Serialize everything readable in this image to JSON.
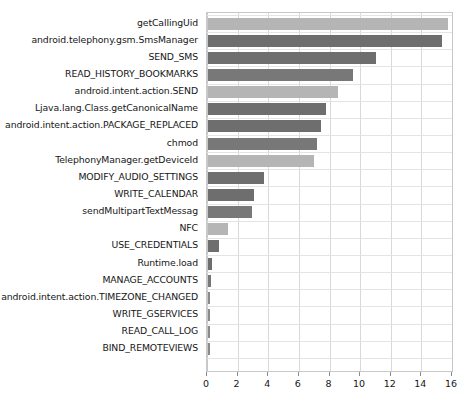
{
  "chart_data": {
    "type": "bar",
    "orientation": "horizontal",
    "title": "",
    "subtitle": "",
    "xlabel": "",
    "ylabel": "",
    "xlim": [
      0,
      16
    ],
    "xticks": [
      0,
      2,
      4,
      6,
      8,
      10,
      12,
      14,
      16
    ],
    "xtick_labels": [
      "0",
      "2",
      "4",
      "6",
      "8",
      "10",
      "12",
      "14",
      "16"
    ],
    "grid": true,
    "legend": null,
    "legend_position": "none",
    "categories": [
      "getCallingUid",
      "android.telephony.gsm.SmsManager",
      "SEND_SMS",
      "READ_HISTORY_BOOKMARKS",
      "android.intent.action.SEND",
      "Ljava.lang.Class.getCanonicalName",
      "android.intent.action.PACKAGE_REPLACED",
      "chmod",
      "TelephonyManager.getDeviceId",
      "MODIFY_AUDIO_SETTINGS",
      "WRITE_CALENDAR",
      "sendMultipartTextMessag",
      "NFC",
      "USE_CREDENTIALS",
      "Runtime.load",
      "MANAGE_ACCOUNTS",
      "android.intent.action.TIMEZONE_CHANGED",
      "WRITE_GSERVICES",
      "READ_CALL_LOG",
      "BIND_REMOTEVIEWS"
    ],
    "values": [
      15.7,
      15.3,
      11.0,
      9.5,
      8.5,
      7.7,
      7.4,
      7.1,
      6.9,
      3.65,
      3.0,
      2.85,
      1.3,
      0.7,
      0.27,
      0.22,
      0.1,
      0.1,
      0.1,
      0.1
    ],
    "bar_colors": [
      "#b5b5b5",
      "#6e6e6e",
      "#6e6e6e",
      "#787878",
      "#b5b5b5",
      "#6e6e6e",
      "#6e6e6e",
      "#787878",
      "#b5b5b5",
      "#6e6e6e",
      "#6e6e6e",
      "#787878",
      "#b5b5b5",
      "#6e6e6e",
      "#6e6e6e",
      "#787878",
      "#8a8a8a",
      "#8a8a8a",
      "#8a8a8a",
      "#8a8a8a"
    ]
  },
  "style": {
    "background": "#ffffff",
    "grid_color": "#d9d9d9",
    "axis_color": "#c8c8c8",
    "text_color": "#161616"
  }
}
